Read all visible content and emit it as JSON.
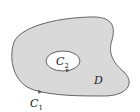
{
  "diagram": {
    "region_label": "D",
    "outer_curve": {
      "label": "C",
      "subscript": "1",
      "orientation": "counterclockwise"
    },
    "inner_curve": {
      "label": "C",
      "subscript": "2",
      "orientation": "clockwise"
    },
    "colors": {
      "region_fill": "#d9d9d9",
      "hole_fill": "#ffffff",
      "stroke": "#555555",
      "text": "#222222"
    }
  }
}
